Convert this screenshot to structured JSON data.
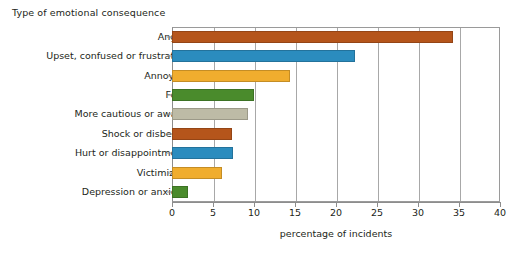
{
  "chart_data": {
    "type": "bar",
    "orientation": "horizontal",
    "title": "",
    "categories": [
      "Anger",
      "Upset, confused or frustrated",
      "Annoyed",
      "Fear",
      "More cautious or aware",
      "Shock or disbelief",
      "Hurt or disappointment",
      "Victimized",
      "Depression or anxiety"
    ],
    "values": [
      34.3,
      22.3,
      14.4,
      10.0,
      9.3,
      7.3,
      7.4,
      6.1,
      2.0
    ],
    "colors": [
      "#b5551b",
      "#2b8cbe",
      "#f0ad2e",
      "#4a8b2c",
      "#bdbba6",
      "#b5551b",
      "#2b8cbe",
      "#f0ad2e",
      "#4a8b2c"
    ],
    "xlabel": "percentage of incidents",
    "ylabel": "Type of emotional consequence",
    "xlim": [
      0,
      40
    ],
    "xticks": [
      0,
      5,
      10,
      15,
      20,
      25,
      30,
      35,
      40
    ],
    "xtick_labels": [
      "0",
      "5",
      "10",
      "15",
      "20",
      "25",
      "30",
      "35",
      "40"
    ],
    "grid": "vertical",
    "legend": "none",
    "accent_colors": {
      "brown": "#b5551b",
      "blue": "#2b8cbe",
      "amber": "#f0ad2e",
      "green": "#4a8b2c",
      "tan": "#bdbba6",
      "axis": "#8d8d8d",
      "text": "#231f20"
    }
  }
}
